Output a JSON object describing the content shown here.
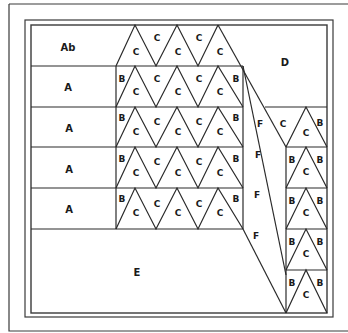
{
  "diagram": {
    "type": "quilt-block pattern layout",
    "colors": {
      "line": "#2a2a2a",
      "background": "#ffffff",
      "text": "#1a1a1a"
    },
    "labels": {
      "row1_left": "Ab",
      "row2_left": "A",
      "row3_left": "A",
      "row4_left": "A",
      "row5_left": "A",
      "bottom_left": "E",
      "top_right": "D",
      "band": "F",
      "side": "B",
      "triangle": "C"
    },
    "sections": [
      {
        "id": "Ab",
        "count": 1,
        "description": "top-left rectangle"
      },
      {
        "id": "A",
        "count": 4,
        "description": "left rectangles rows 2-5"
      },
      {
        "id": "B",
        "count": 14,
        "description": "side half-triangles"
      },
      {
        "id": "C",
        "count": 29,
        "description": "triangles"
      },
      {
        "id": "D",
        "count": 1,
        "description": "top-right region"
      },
      {
        "id": "E",
        "count": 1,
        "description": "bottom-left region"
      },
      {
        "id": "F",
        "count": 4,
        "description": "diagonal band labels"
      }
    ]
  }
}
